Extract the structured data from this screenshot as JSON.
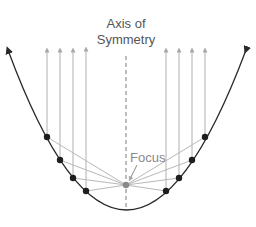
{
  "diagram": {
    "title_line1": "Axis of",
    "title_line2": "Symmetry",
    "focus_label": "Focus",
    "colors": {
      "curve": "#2a2a2a",
      "points": "#1e1e1e",
      "rays": "#b0b0b0",
      "axis": "#7a7a7a",
      "focus_point": "#8a8a8a",
      "text": "#555555"
    },
    "vertex": [
      126,
      209
    ],
    "focus": [
      126,
      185
    ],
    "points_left": [
      [
        47,
        137
      ],
      [
        60,
        160
      ],
      [
        73,
        178
      ],
      [
        86,
        191
      ]
    ],
    "points_right": [
      [
        166,
        191
      ],
      [
        179,
        178
      ],
      [
        192,
        160
      ],
      [
        205,
        137
      ]
    ],
    "ray_top_y": 48
  }
}
